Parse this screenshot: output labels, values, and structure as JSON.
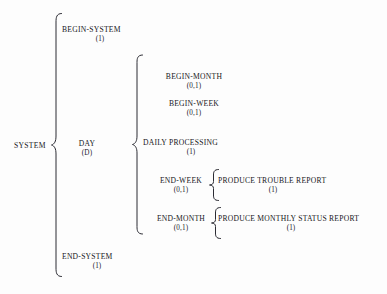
{
  "diagram": {
    "type": "warnier-orr-bracket-diagram",
    "stroke_color": "#2b2b33",
    "background_color": "#fdfdfd",
    "root": {
      "label": "SYSTEM"
    },
    "levels": [
      {
        "level": 1,
        "brace_name": "brace-system",
        "nodes": [
          {
            "name": "BEGIN-SYSTEM",
            "cardinality": "(1)"
          },
          {
            "name": "DAY",
            "cardinality": "(D)"
          },
          {
            "name": "END-SYSTEM",
            "cardinality": "(1)"
          }
        ]
      },
      {
        "level": 2,
        "brace_name": "brace-day",
        "parent": "DAY",
        "nodes": [
          {
            "name": "BEGIN-MONTH",
            "cardinality": "(0,1)"
          },
          {
            "name": "BEGIN-WEEK",
            "cardinality": "(0,1)"
          },
          {
            "name": "DAILY PROCESSING",
            "cardinality": "(1)"
          },
          {
            "name": "END-WEEK",
            "cardinality": "(0,1)"
          },
          {
            "name": "END-MONTH",
            "cardinality": "(0,1)"
          }
        ]
      },
      {
        "level": 3,
        "brace_name": "brace-end-week",
        "parent": "END-WEEK",
        "nodes": [
          {
            "name": "PRODUCE TROUBLE REPORT",
            "cardinality": "(1)"
          }
        ]
      },
      {
        "level": 3,
        "brace_name": "brace-end-month",
        "parent": "END-MONTH",
        "nodes": [
          {
            "name": "PRODUCE MONTHLY STATUS REPORT",
            "cardinality": "(1)"
          }
        ]
      }
    ],
    "nodes_flat": {
      "begin_system": {
        "name": "BEGIN-SYSTEM",
        "cardinality": "(1)"
      },
      "day": {
        "name": "DAY",
        "cardinality": "(D)"
      },
      "end_system": {
        "name": "END-SYSTEM",
        "cardinality": "(1)"
      },
      "begin_month": {
        "name": "BEGIN-MONTH",
        "cardinality": "(0,1)"
      },
      "begin_week": {
        "name": "BEGIN-WEEK",
        "cardinality": "(0,1)"
      },
      "daily_processing": {
        "name": "DAILY PROCESSING",
        "cardinality": "(1)"
      },
      "end_week": {
        "name": "END-WEEK",
        "cardinality": "(0,1)"
      },
      "end_month": {
        "name": "END-MONTH",
        "cardinality": "(0,1)"
      },
      "produce_trouble_report": {
        "name": "PRODUCE TROUBLE REPORT",
        "cardinality": "(1)"
      },
      "produce_monthly_status_report": {
        "name": "PRODUCE MONTHLY STATUS REPORT",
        "cardinality": "(1)"
      }
    }
  }
}
